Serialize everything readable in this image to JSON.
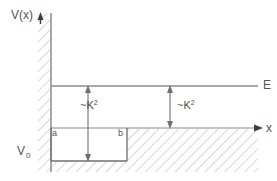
{
  "figure": {
    "kind": "potential-well-energy-diagram",
    "background_color": "#ffffff",
    "line_color": "#7a7a7a",
    "text_color": "#555555",
    "hatch_color": "#b3b3b3"
  },
  "axes": {
    "y_axis_label": "V(x)",
    "x_axis_label": "x",
    "origin": {
      "x": 51,
      "y": 128
    },
    "x_axis_end": 262,
    "y_axis_top": 12
  },
  "levels": {
    "energy_label": "E",
    "energy_line_y": 86,
    "potential_floor_label": "V",
    "potential_floor_subscript": "0",
    "well_bottom_y": 161
  },
  "well": {
    "left_boundary_label": "a",
    "right_boundary_label": "b",
    "left_x": 51,
    "right_x": 127
  },
  "annotations": [
    {
      "id": "k2-left",
      "text": "~K",
      "superscript": "2",
      "arrow_x": 88,
      "arrow_top_y": 86,
      "arrow_bottom_y": 161
    },
    {
      "id": "k2-right",
      "text": "~K",
      "superscript": "2",
      "arrow_x": 170,
      "arrow_top_y": 86,
      "arrow_bottom_y": 128
    }
  ]
}
